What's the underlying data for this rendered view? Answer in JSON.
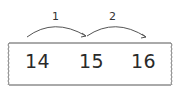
{
  "diagram": {
    "type": "number-line-strip",
    "numbers": [
      "14",
      "15",
      "16"
    ],
    "jumps": [
      {
        "from": "14",
        "to": "15",
        "label": "1"
      },
      {
        "from": "15",
        "to": "16",
        "label": "2"
      }
    ],
    "colors": {
      "stroke": "#555555",
      "text": "#2a2a2a"
    }
  }
}
